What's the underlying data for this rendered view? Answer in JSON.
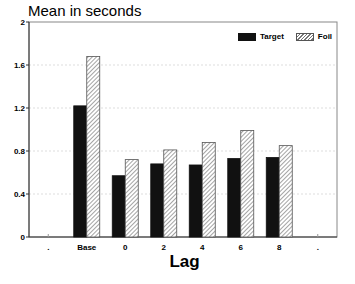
{
  "chart_data": {
    "type": "bar",
    "title": "Mean in seconds",
    "xlabel": "Lag",
    "ylabel": "Mean in seconds",
    "ylim": [
      0,
      2
    ],
    "yticks": [
      "0",
      "0.4",
      "0.8",
      "1.2",
      "1.6",
      "2"
    ],
    "xtick_labels": [
      ".",
      "Base",
      "0",
      "2",
      "4",
      "6",
      "8",
      "."
    ],
    "categories": [
      "Base",
      "0",
      "2",
      "4",
      "6",
      "8"
    ],
    "series": [
      {
        "name": "Target",
        "color": "#111111",
        "pattern": "solid",
        "values": [
          1.22,
          0.57,
          0.68,
          0.67,
          0.73,
          0.74
        ]
      },
      {
        "name": "Foil",
        "color": "#777777",
        "pattern": "hatched",
        "values": [
          1.68,
          0.72,
          0.81,
          0.88,
          0.99,
          0.85
        ]
      }
    ],
    "legend_position": "top-right",
    "grid": true
  },
  "legend": {
    "target_label": "Target",
    "foil_label": "Foil"
  }
}
